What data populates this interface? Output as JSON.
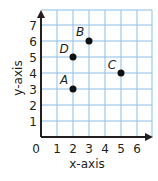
{
  "chart_data": {
    "type": "scatter",
    "title": "",
    "xlabel": "x-axis",
    "ylabel": "y-axis",
    "xlim": [
      0,
      6
    ],
    "ylim": [
      0,
      7
    ],
    "grid": true,
    "x_ticks": [
      "0",
      "1",
      "2",
      "3",
      "4",
      "5",
      "6"
    ],
    "y_ticks": [
      "1",
      "2",
      "3",
      "4",
      "5",
      "6",
      "7"
    ],
    "points": [
      {
        "label": "A",
        "x": 2,
        "y": 3
      },
      {
        "label": "B",
        "x": 3,
        "y": 6
      },
      {
        "label": "C",
        "x": 5,
        "y": 4
      },
      {
        "label": "D",
        "x": 2,
        "y": 5
      }
    ],
    "colors": {
      "grid": "#8dbde3",
      "axis": "#231f20",
      "point": "#111111"
    }
  }
}
